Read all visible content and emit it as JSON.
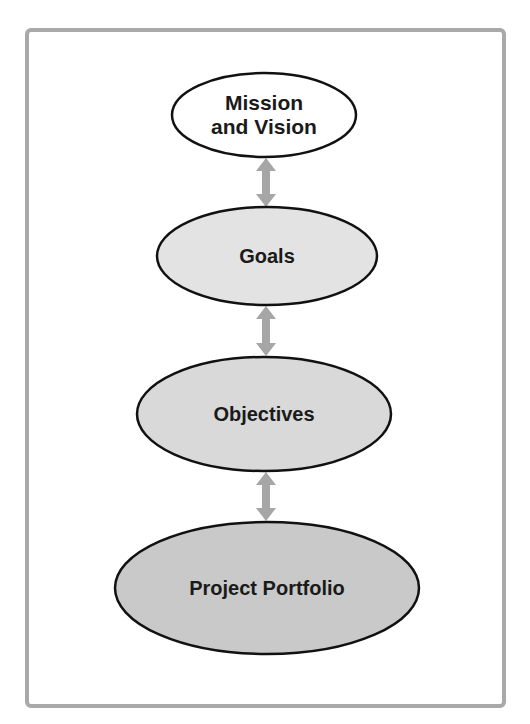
{
  "diagram": {
    "type": "hierarchy-flow",
    "nodes": [
      {
        "id": "mission",
        "label": "Mission\nand Vision",
        "cx": 264,
        "cy": 115,
        "rx": 92,
        "ry": 42,
        "fill": "#ffffff",
        "font_size": 21
      },
      {
        "id": "goals",
        "label": "Goals",
        "cx": 267,
        "cy": 256,
        "rx": 110,
        "ry": 49,
        "fill": "#e3e3e3",
        "font_size": 20
      },
      {
        "id": "objectives",
        "label": "Objectives",
        "cx": 264,
        "cy": 414,
        "rx": 127,
        "ry": 57,
        "fill": "#d9d9d9",
        "font_size": 20
      },
      {
        "id": "portfolio",
        "label": "Project Portfolio",
        "cx": 267,
        "cy": 588,
        "rx": 152,
        "ry": 66,
        "fill": "#c9c9c9",
        "font_size": 20
      }
    ],
    "edges": [
      {
        "from": "mission",
        "to": "goals",
        "type": "bidirectional",
        "x": 266,
        "y1": 158,
        "y2": 207
      },
      {
        "from": "goals",
        "to": "objectives",
        "type": "bidirectional",
        "x": 266,
        "y1": 306,
        "y2": 356
      },
      {
        "from": "objectives",
        "to": "portfolio",
        "type": "bidirectional",
        "x": 266,
        "y1": 472,
        "y2": 521
      }
    ],
    "colors": {
      "frame_border": "#a9a9a9",
      "arrow": "#a6a6a6",
      "ellipse_stroke": "#111111",
      "text": "#1a1a1a"
    }
  }
}
